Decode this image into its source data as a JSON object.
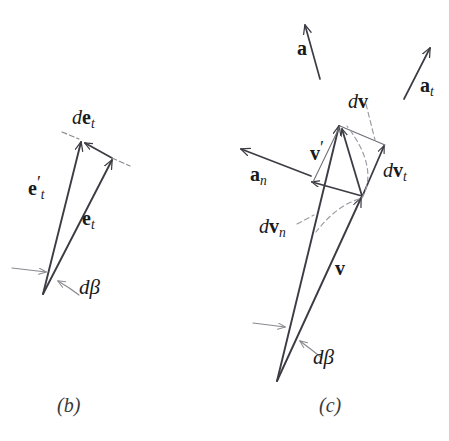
{
  "figure": {
    "background_color": "#ffffff",
    "ink_color": "#3c3c44",
    "light_ink_color": "#8a8a90",
    "text_color": "#1a1a1a",
    "panels": [
      {
        "id": "b",
        "caption": "(b)",
        "description": "Unit tangent vector increment diagram",
        "labels": [
          {
            "name": "de-t",
            "html": "<i>d</i><b>e</b><sub>t</sub>",
            "x": 72,
            "y": 107
          },
          {
            "name": "e-t-prime",
            "html": "<b>e</b><span class='pr'>&#8242;</span><sub>t</sub>",
            "x": 28,
            "y": 174
          },
          {
            "name": "e-t",
            "html": "<b>e</b><sub>t</sub>",
            "x": 82,
            "y": 208
          },
          {
            "name": "d-beta",
            "html": "<i>d&#946;</i>",
            "x": 79,
            "y": 277
          }
        ]
      },
      {
        "id": "c",
        "caption": "(c)",
        "description": "Velocity increment and acceleration decomposition diagram",
        "labels": [
          {
            "name": "a",
            "html": "<b>a</b>",
            "x": 297,
            "y": 38
          },
          {
            "name": "a-t",
            "html": "<b>a</b><sub>t</sub>",
            "x": 420,
            "y": 75
          },
          {
            "name": "dv",
            "html": "<i>d</i><b>v</b>",
            "x": 348,
            "y": 91
          },
          {
            "name": "v-prime",
            "html": "<b>v</b><span class='pr'>&#8242;</span>",
            "x": 310,
            "y": 139
          },
          {
            "name": "dv-t",
            "html": "<i>d</i><b>v</b><sub>t</sub>",
            "x": 383,
            "y": 160
          },
          {
            "name": "a-n",
            "html": "<b>a</b><sub>n</sub>",
            "x": 250,
            "y": 164
          },
          {
            "name": "dv-n",
            "html": "<i>d</i><b>v</b><sub>n</sub>",
            "x": 259,
            "y": 216
          },
          {
            "name": "v",
            "html": "<b>v</b>",
            "x": 335,
            "y": 258
          },
          {
            "name": "d-beta",
            "html": "<i>d&#946;</i>",
            "x": 313,
            "y": 347
          }
        ]
      }
    ]
  },
  "geometry": {
    "panel_b": {
      "origin": [
        43,
        294
      ],
      "e_t_prime_tip": [
        81,
        141
      ],
      "e_t_tip": [
        112,
        159
      ],
      "de_t_from": [
        112,
        159
      ],
      "de_t_to": [
        83,
        143
      ]
    },
    "panel_c": {
      "origin": [
        277,
        381
      ],
      "v_prime_tip": [
        340,
        124
      ],
      "v_tip": [
        362,
        196
      ],
      "dv_t_tip": [
        385,
        144
      ],
      "dv_n_from": [
        362,
        196
      ],
      "dv_n_to": [
        313,
        182
      ],
      "a_from": [
        320,
        78
      ],
      "a_to": [
        303,
        22
      ],
      "a_t_from": [
        404,
        98
      ],
      "a_t_to": [
        431,
        46
      ],
      "a_n_from": [
        311,
        176
      ],
      "a_n_to": [
        238,
        148
      ]
    }
  },
  "captions": {
    "b": {
      "text": "(b)",
      "x": 57,
      "y": 394
    },
    "c": {
      "text": "(c)",
      "x": 319,
      "y": 394
    }
  }
}
